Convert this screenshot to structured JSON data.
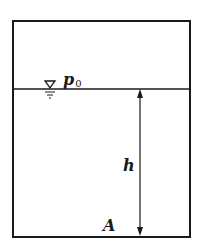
{
  "diagram": {
    "type": "hydrostatic-tank",
    "labels": {
      "surface_pressure": "p",
      "surface_pressure_subscript": "0",
      "depth": "h",
      "point": "A"
    },
    "symbols": {
      "free_surface": "water-surface-triangle-icon",
      "depth_dimension": "double-headed-arrow"
    },
    "colors": {
      "stroke": "#1a1a1a",
      "background": "#ffffff"
    }
  }
}
